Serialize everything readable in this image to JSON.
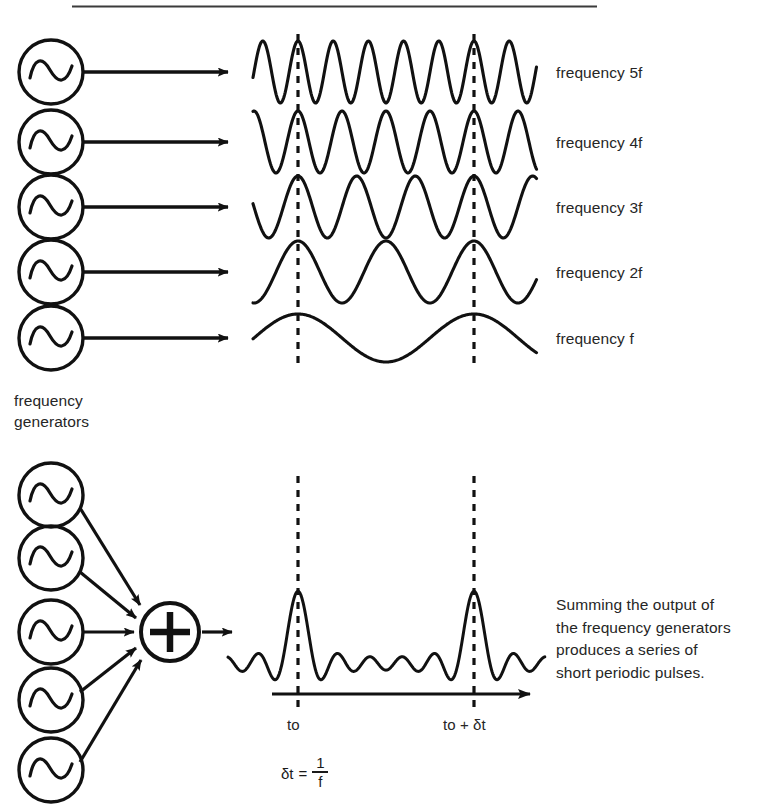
{
  "figure": {
    "title_rule": "horizontal-rule",
    "background": "#ffffff",
    "ink": "#111111"
  },
  "top_section": {
    "generators_label": "frequency\ngenerators",
    "generator_icon": "sine-wave-generator-icon",
    "arrow_icon": "arrow-right-icon",
    "rows": [
      {
        "label": "frequency 5f",
        "harmonic": 5
      },
      {
        "label": "frequency 4f",
        "harmonic": 4
      },
      {
        "label": "frequency 3f",
        "harmonic": 3
      },
      {
        "label": "frequency 2f",
        "harmonic": 2
      },
      {
        "label": "frequency f",
        "harmonic": 1
      }
    ]
  },
  "bottom_section": {
    "summing_node_symbol": "+",
    "summing_node_icon": "plus-circle-icon",
    "description": "Summing the output of\nthe frequency generators\nproduces a series of\nshort periodic pulses.",
    "time_axis": {
      "arrow_icon": "arrow-right-icon",
      "tick_start_label": "to",
      "tick_end_label": "to + δt"
    },
    "formula": {
      "lhs": "δt",
      "equals": "=",
      "numerator": "1",
      "denominator": "f"
    }
  },
  "chart_data": {
    "type": "line",
    "xlabel": "time",
    "ylabel": "amplitude",
    "grid": false,
    "legend_position": "right",
    "annotations": [
      {
        "text": "to",
        "x_marker": "dashed-line-1"
      },
      {
        "text": "to + δt",
        "x_marker": "dashed-line-2"
      },
      {
        "text": "δt = 1/f",
        "note": "pulse period equals inverse of fundamental frequency"
      }
    ],
    "markers": {
      "dashed_vertical_lines_x": [
        298,
        474
      ],
      "period_between_markers": "1/f"
    },
    "series": [
      {
        "name": "frequency 5f",
        "harmonic": 5,
        "amplitude": 1,
        "phase_deg": 0,
        "cycles_between_markers": 5
      },
      {
        "name": "frequency 4f",
        "harmonic": 4,
        "amplitude": 1,
        "phase_deg": 0,
        "cycles_between_markers": 4
      },
      {
        "name": "frequency 3f",
        "harmonic": 3,
        "amplitude": 1,
        "phase_deg": 0,
        "cycles_between_markers": 3
      },
      {
        "name": "frequency 2f",
        "harmonic": 2,
        "amplitude": 1,
        "phase_deg": 0,
        "cycles_between_markers": 2
      },
      {
        "name": "frequency f",
        "harmonic": 1,
        "amplitude": 1,
        "phase_deg": 0,
        "cycles_between_markers": 1
      },
      {
        "name": "sum of harmonics 1..5",
        "harmonics": [
          1,
          2,
          3,
          4,
          5
        ],
        "amplitude": 5,
        "peak_count_visible": 2
      }
    ]
  }
}
